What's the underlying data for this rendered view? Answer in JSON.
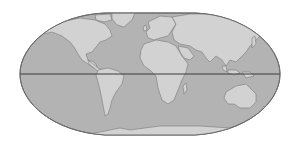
{
  "map": {
    "projection": "flat-polar pseudocylindrical world map",
    "features": [
      "ocean",
      "continents",
      "equator-line"
    ],
    "colors": {
      "background": "#ffffff",
      "ocean": "#b3b3b3",
      "land": "#d2d2d2",
      "coastline": "#7a7a7a",
      "border": "#6a6a6a",
      "equator": "#3a3a3a"
    },
    "continents": [
      "North America",
      "South America",
      "Europe",
      "Africa",
      "Asia",
      "Australia",
      "Antarctica",
      "Greenland"
    ]
  }
}
